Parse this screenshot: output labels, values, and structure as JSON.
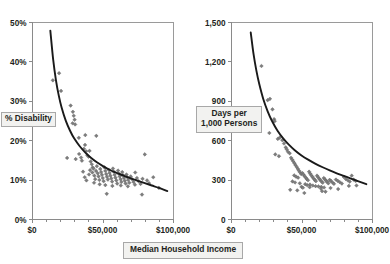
{
  "figure": {
    "panel_count": 2,
    "background_color": "#ffffff",
    "shared_x_axis_title": "Median Household Income",
    "marker_color": "#7d7d7d",
    "curve_color": "#1a1a1a",
    "axis_color": "#8a8a8a",
    "title_box_fill": "#f2f2f0"
  },
  "chart_data": [
    {
      "type": "scatter",
      "id": "disability-vs-income",
      "title": "",
      "xlabel": "Median Household Income",
      "ylabel": "% Disability",
      "xlim": [
        0,
        100000
      ],
      "ylim": [
        0,
        0.5
      ],
      "grid": false,
      "legend": "none",
      "x_ticks": [
        0,
        50000,
        100000
      ],
      "x_tick_labels": [
        "$0",
        "$50,000",
        "$100,000"
      ],
      "x_minor_tick_step": 10000,
      "y_ticks": [
        0,
        0.1,
        0.2,
        0.3,
        0.4,
        0.5
      ],
      "y_tick_labels": [
        "0%",
        "10%",
        "20%",
        "30%",
        "40%",
        "50%"
      ],
      "trend_type": "power-decay",
      "trend_note": "Fitted declining curve from ~48% at $13,000 down to ~7% at $96,000",
      "trend_points": [
        [
          13000,
          0.478
        ],
        [
          15000,
          0.405
        ],
        [
          17000,
          0.352
        ],
        [
          19000,
          0.313
        ],
        [
          21000,
          0.283
        ],
        [
          24000,
          0.249
        ],
        [
          27000,
          0.224
        ],
        [
          30000,
          0.204
        ],
        [
          34000,
          0.184
        ],
        [
          38000,
          0.168
        ],
        [
          42000,
          0.155
        ],
        [
          46000,
          0.144
        ],
        [
          50000,
          0.135
        ],
        [
          55000,
          0.125
        ],
        [
          60000,
          0.117
        ],
        [
          65000,
          0.11
        ],
        [
          70000,
          0.103
        ],
        [
          75000,
          0.097
        ],
        [
          80000,
          0.091
        ],
        [
          85000,
          0.085
        ],
        [
          90000,
          0.079
        ],
        [
          96000,
          0.071
        ]
      ],
      "points": [
        [
          14800,
          0.352
        ],
        [
          19200,
          0.37
        ],
        [
          20600,
          0.325
        ],
        [
          27400,
          0.288
        ],
        [
          29000,
          0.272
        ],
        [
          29600,
          0.262
        ],
        [
          30200,
          0.252
        ],
        [
          28800,
          0.243
        ],
        [
          30600,
          0.24
        ],
        [
          33200,
          0.206
        ],
        [
          37800,
          0.213
        ],
        [
          45600,
          0.211
        ],
        [
          24900,
          0.155
        ],
        [
          31000,
          0.152
        ],
        [
          33400,
          0.165
        ],
        [
          34800,
          0.156
        ],
        [
          35400,
          0.148
        ],
        [
          36800,
          0.178
        ],
        [
          37600,
          0.188
        ],
        [
          38400,
          0.172
        ],
        [
          39200,
          0.162
        ],
        [
          40100,
          0.158
        ],
        [
          40800,
          0.173
        ],
        [
          41600,
          0.146
        ],
        [
          42400,
          0.139
        ],
        [
          43000,
          0.131
        ],
        [
          36200,
          0.12
        ],
        [
          37400,
          0.106
        ],
        [
          38600,
          0.098
        ],
        [
          40400,
          0.113
        ],
        [
          41200,
          0.124
        ],
        [
          42800,
          0.118
        ],
        [
          43600,
          0.128
        ],
        [
          44200,
          0.11
        ],
        [
          44800,
          0.101
        ],
        [
          45400,
          0.122
        ],
        [
          46000,
          0.134
        ],
        [
          46600,
          0.116
        ],
        [
          47200,
          0.108
        ],
        [
          47800,
          0.099
        ],
        [
          48400,
          0.127
        ],
        [
          49000,
          0.119
        ],
        [
          49600,
          0.112
        ],
        [
          50200,
          0.104
        ],
        [
          50800,
          0.096
        ],
        [
          51400,
          0.131
        ],
        [
          52000,
          0.122
        ],
        [
          52600,
          0.114
        ],
        [
          53200,
          0.107
        ],
        [
          53800,
          0.1
        ],
        [
          54400,
          0.125
        ],
        [
          55000,
          0.117
        ],
        [
          55600,
          0.11
        ],
        [
          56200,
          0.103
        ],
        [
          56800,
          0.095
        ],
        [
          57400,
          0.128
        ],
        [
          58000,
          0.12
        ],
        [
          58600,
          0.112
        ],
        [
          59200,
          0.105
        ],
        [
          59800,
          0.098
        ],
        [
          60400,
          0.09
        ],
        [
          61000,
          0.123
        ],
        [
          61600,
          0.115
        ],
        [
          62200,
          0.108
        ],
        [
          62800,
          0.101
        ],
        [
          63400,
          0.094
        ],
        [
          64000,
          0.119
        ],
        [
          64600,
          0.111
        ],
        [
          65200,
          0.104
        ],
        [
          65800,
          0.097
        ],
        [
          66400,
          0.09
        ],
        [
          67000,
          0.113
        ],
        [
          67600,
          0.106
        ],
        [
          68200,
          0.099
        ],
        [
          69000,
          0.092
        ],
        [
          70000,
          0.108
        ],
        [
          71000,
          0.101
        ],
        [
          72000,
          0.094
        ],
        [
          73200,
          0.118
        ],
        [
          74400,
          0.104
        ],
        [
          75600,
          0.096
        ],
        [
          77000,
          0.089
        ],
        [
          78400,
          0.102
        ],
        [
          80000,
          0.164
        ],
        [
          81600,
          0.098
        ],
        [
          83000,
          0.091
        ],
        [
          78000,
          0.062
        ],
        [
          53000,
          0.064
        ],
        [
          52000,
          0.086
        ],
        [
          44000,
          0.092
        ],
        [
          48000,
          0.088
        ],
        [
          57000,
          0.084
        ],
        [
          63000,
          0.085
        ],
        [
          68000,
          0.083
        ],
        [
          73000,
          0.087
        ],
        [
          86000,
          0.106
        ],
        [
          90000,
          0.079
        ]
      ]
    },
    {
      "type": "scatter",
      "id": "days-vs-income",
      "title": "",
      "xlabel": "Median Household Income",
      "ylabel": "Days per 1,000 Persons",
      "xlim": [
        0,
        100000
      ],
      "ylim": [
        0,
        1500
      ],
      "grid": false,
      "legend": "none",
      "x_ticks": [
        0,
        50000,
        100000
      ],
      "x_tick_labels": [
        "$0",
        "$50,000",
        "$100,000"
      ],
      "x_minor_tick_step": 10000,
      "y_ticks": [
        0,
        300,
        600,
        900,
        1200,
        1500
      ],
      "y_tick_labels": [
        "0",
        "300",
        "600",
        "900",
        "1,200",
        "1,500"
      ],
      "trend_type": "power-decay",
      "trend_note": "Fitted declining curve from ~1,420 at $14,000 down to ~205 at $96,000",
      "trend_points": [
        [
          14000,
          1420
        ],
        [
          16000,
          1255
        ],
        [
          18000,
          1130
        ],
        [
          20000,
          1030
        ],
        [
          23000,
          910
        ],
        [
          26000,
          820
        ],
        [
          29000,
          748
        ],
        [
          33000,
          672
        ],
        [
          37000,
          614
        ],
        [
          41000,
          566
        ],
        [
          45000,
          526
        ],
        [
          50000,
          484
        ],
        [
          55000,
          450
        ],
        [
          60000,
          420
        ],
        [
          65000,
          394
        ],
        [
          70000,
          370
        ],
        [
          75000,
          348
        ],
        [
          80000,
          328
        ],
        [
          85000,
          308
        ],
        [
          90000,
          288
        ],
        [
          96000,
          265
        ]
      ],
      "trend_points_note": "Curve flattens near 210-265 at the high-income end",
      "points": [
        [
          21600,
          1165
        ],
        [
          26000,
          905
        ],
        [
          27600,
          915
        ],
        [
          29400,
          835
        ],
        [
          30600,
          760
        ],
        [
          31000,
          745
        ],
        [
          27200,
          655
        ],
        [
          33200,
          610
        ],
        [
          34600,
          620
        ],
        [
          36400,
          600
        ],
        [
          37600,
          575
        ],
        [
          31400,
          492
        ],
        [
          38800,
          545
        ],
        [
          39600,
          530
        ],
        [
          40400,
          512
        ],
        [
          34000,
          478
        ],
        [
          41600,
          500
        ],
        [
          42600,
          466
        ],
        [
          43400,
          452
        ],
        [
          44200,
          438
        ],
        [
          45000,
          424
        ],
        [
          45800,
          410
        ],
        [
          46600,
          396
        ],
        [
          47400,
          382
        ],
        [
          48200,
          368
        ],
        [
          49000,
          355
        ],
        [
          49800,
          342
        ],
        [
          44800,
          332
        ],
        [
          46200,
          322
        ],
        [
          47600,
          315
        ],
        [
          50600,
          350
        ],
        [
          51400,
          338
        ],
        [
          52200,
          326
        ],
        [
          53000,
          315
        ],
        [
          53800,
          304
        ],
        [
          54600,
          295
        ],
        [
          43600,
          286
        ],
        [
          45400,
          278
        ],
        [
          48800,
          272
        ],
        [
          55400,
          360
        ],
        [
          56200,
          345
        ],
        [
          57000,
          332
        ],
        [
          57800,
          320
        ],
        [
          58600,
          308
        ],
        [
          59400,
          298
        ],
        [
          60200,
          288
        ],
        [
          61000,
          330
        ],
        [
          61800,
          318
        ],
        [
          62600,
          306
        ],
        [
          63400,
          296
        ],
        [
          64200,
          286
        ],
        [
          65000,
          276
        ],
        [
          65800,
          312
        ],
        [
          66600,
          302
        ],
        [
          67400,
          292
        ],
        [
          68200,
          282
        ],
        [
          69000,
          272
        ],
        [
          70000,
          298
        ],
        [
          71000,
          288
        ],
        [
          72000,
          278
        ],
        [
          73000,
          268
        ],
        [
          74400,
          300
        ],
        [
          75800,
          290
        ],
        [
          77200,
          280
        ],
        [
          78600,
          270
        ],
        [
          80000,
          320
        ],
        [
          81400,
          305
        ],
        [
          82800,
          295
        ],
        [
          84200,
          285
        ],
        [
          85600,
          330
        ],
        [
          87000,
          300
        ],
        [
          88400,
          290
        ],
        [
          52600,
          265
        ],
        [
          54000,
          258
        ],
        [
          56000,
          262
        ],
        [
          58000,
          255
        ],
        [
          60000,
          250
        ],
        [
          62000,
          248
        ],
        [
          64000,
          244
        ],
        [
          66000,
          240
        ],
        [
          42000,
          222
        ],
        [
          47000,
          218
        ],
        [
          52000,
          198
        ],
        [
          64600,
          212
        ],
        [
          67000,
          208
        ],
        [
          50000,
          245
        ],
        [
          51000,
          238
        ],
        [
          55800,
          242
        ],
        [
          63800,
          232
        ],
        [
          70600,
          236
        ],
        [
          76000,
          228
        ],
        [
          83600,
          252
        ],
        [
          89000,
          255
        ]
      ]
    }
  ],
  "panel_left": {
    "y_axis_title": "% Disability",
    "y_tick_labels": [
      "50%",
      "40%",
      "30%",
      "20%",
      "10%",
      "0%"
    ],
    "x_tick_labels": [
      "$0",
      "$50,000",
      "$100,000"
    ]
  },
  "panel_right": {
    "y_axis_title_line1": "Days per",
    "y_axis_title_line2": "1,000 Persons",
    "y_tick_labels": [
      "1,500",
      "1,200",
      "900",
      "600",
      "300",
      "0"
    ],
    "x_tick_labels": [
      "$0",
      "$50,000",
      "$100,000"
    ]
  }
}
